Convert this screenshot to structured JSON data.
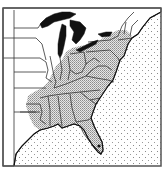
{
  "map": {
    "type": "species range map",
    "region": "Eastern United States",
    "style": "monochrome line map",
    "colors": {
      "background": "#ffffff",
      "land": "#ffffff",
      "range_fill": "#c8c8c8",
      "lakes": "#111111",
      "ocean_dots": "#8a8a8a",
      "borders": "#333333",
      "frame": "#555555"
    },
    "legend": {
      "range_pattern": "stippled-gray",
      "ocean_pattern": "dotted",
      "lakes_pattern": "solid-black"
    },
    "range_states": [
      "Ohio",
      "Indiana",
      "Kentucky",
      "Tennessee",
      "West Virginia",
      "Pennsylvania",
      "Virginia",
      "North Carolina",
      "South Carolina",
      "Georgia",
      "Alabama",
      "Mississippi",
      "Louisiana",
      "Arkansas (east)",
      "Florida",
      "Maryland",
      "Delaware",
      "New Jersey",
      "New York (south)",
      "Connecticut",
      "Massachusetts",
      "Illinois (south)",
      "Missouri (southeast)",
      "Texas (east)",
      "Oklahoma (east)"
    ],
    "unshaded_states": [
      "Minnesota",
      "Wisconsin",
      "Iowa",
      "Missouri (north)",
      "Michigan",
      "Maine",
      "Vermont",
      "New Hampshire",
      "Kansas",
      "Nebraska"
    ]
  }
}
